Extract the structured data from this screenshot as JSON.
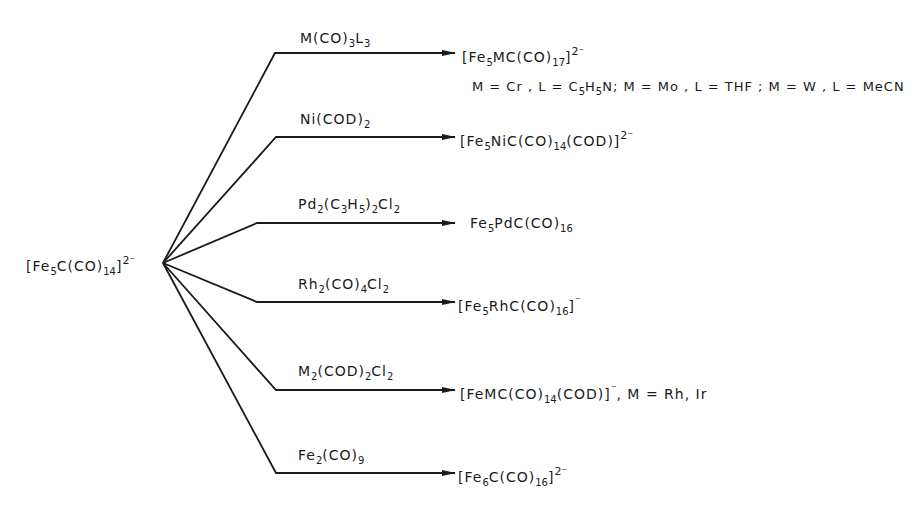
{
  "diagram": {
    "type": "reaction-scheme",
    "reactant": {
      "formula": "[Fe5C(CO)14]2-",
      "parts": {
        "a": "[Fe",
        "b": "5",
        "c": "C(CO)",
        "d": "14",
        "e": "]",
        "f": "2-"
      }
    },
    "branches": [
      {
        "reagent": "M(CO)3L3",
        "product": "[Fe5MC(CO)17]2-",
        "note": "M = Cr, L = C5H5N; M = Mo, L = THF; M = W, L = MeCN"
      },
      {
        "reagent": "Ni(COD)2",
        "product": "[Fe5NiC(CO)14(COD)]2-",
        "note": ""
      },
      {
        "reagent": "Pd2(C3H5)2Cl2",
        "product": "Fe5PdC(CO)16",
        "note": ""
      },
      {
        "reagent": "Rh2(CO)4Cl2",
        "product": "[Fe5RhC(CO)16]-",
        "note": ""
      },
      {
        "reagent": "M2(COD)2Cl2",
        "product": "[FeMC(CO)14(COD)]-",
        "note": "M = Rh, Ir"
      },
      {
        "reagent": "Fe2(CO)9",
        "product": "[Fe6C(CO)16]2-",
        "note": ""
      }
    ],
    "line_color": "#1a1a1a"
  }
}
